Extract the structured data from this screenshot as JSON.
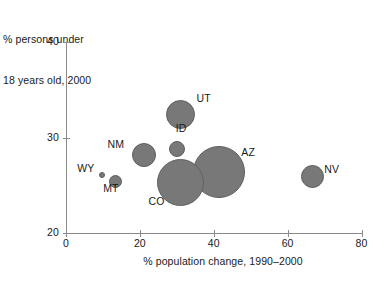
{
  "chart_data": {
    "type": "scatter",
    "title": "",
    "ylabel": "% persons under\n18 years old, 2000",
    "ylabel_lines": [
      "% persons under",
      "18 years old, 2000"
    ],
    "xlabel": "% population change, 1990–2000",
    "xlim": [
      0,
      80
    ],
    "ylim": [
      20,
      40
    ],
    "xticks": [
      0,
      20,
      40,
      60,
      80
    ],
    "xtick_labels": [
      "0",
      "20",
      "40",
      "60",
      "80"
    ],
    "yticks": [
      20,
      30,
      40
    ],
    "ytick_labels": [
      "20",
      "30",
      "40"
    ],
    "grid": false,
    "legend": "none",
    "bubble_color": "#787878",
    "bubble_edge_color": "#5f5f5f",
    "axis_color": "#8a8a8a",
    "text_color": "#1a1a1a",
    "size_encodes": "population",
    "points": [
      {
        "label": "UT",
        "x": 31.0,
        "y": 32.4,
        "r_px": 14.5,
        "label_dx": 16,
        "label_dy": -17
      },
      {
        "label": "NM",
        "x": 21.0,
        "y": 28.2,
        "r_px": 12.0,
        "label_dx": -36,
        "label_dy": -11
      },
      {
        "label": "ID",
        "x": 30.0,
        "y": 28.8,
        "r_px": 8.0,
        "label_dx": -1,
        "label_dy": -21
      },
      {
        "label": "CO",
        "x": 31.0,
        "y": 25.3,
        "r_px": 23.5,
        "label_dx": -32,
        "label_dy": 19
      },
      {
        "label": "AZ",
        "x": 41.5,
        "y": 26.4,
        "r_px": 26.0,
        "label_dx": 22,
        "label_dy": -20
      },
      {
        "label": "NV",
        "x": 66.7,
        "y": 25.9,
        "r_px": 11.5,
        "label_dx": 12,
        "label_dy": -8
      },
      {
        "label": "WY",
        "x": 9.8,
        "y": 26.1,
        "r_px": 3.0,
        "label_dx": -25,
        "label_dy": -7
      },
      {
        "label": "MT",
        "x": 13.3,
        "y": 25.4,
        "r_px": 6.5,
        "label_dx": -12,
        "label_dy": 7
      }
    ]
  }
}
